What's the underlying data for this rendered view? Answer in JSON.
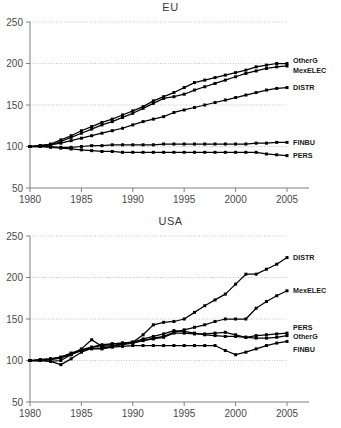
{
  "figure": {
    "panels": [
      "EU",
      "USA"
    ],
    "width": 341,
    "height": 428,
    "background": "#ffffff",
    "line_color": "#000000",
    "grid_color": "#b5b5b5",
    "axis_color": "#808080"
  },
  "chart_data": [
    {
      "type": "line",
      "title": "EU",
      "xlabel": "",
      "ylabel": "",
      "xlim": [
        1980,
        2005
      ],
      "ylim": [
        50,
        250
      ],
      "xticks": [
        1980,
        1985,
        1990,
        1995,
        2000,
        2005
      ],
      "yticks": [
        50,
        100,
        150,
        200,
        250
      ],
      "grid": true,
      "grid_axis": "y",
      "legend": "right-inline",
      "marker": "square",
      "x": [
        1980,
        1981,
        1982,
        1983,
        1984,
        1985,
        1986,
        1987,
        1988,
        1989,
        1990,
        1991,
        1992,
        1993,
        1994,
        1995,
        1996,
        1997,
        1998,
        1999,
        2000,
        2001,
        2002,
        2003,
        2004,
        2005
      ],
      "series": [
        {
          "name": "OtherG",
          "label": "OtherG",
          "end_value": 200,
          "values": [
            100,
            101,
            103,
            108,
            113,
            119,
            124,
            129,
            133,
            138,
            143,
            148,
            155,
            160,
            165,
            171,
            177,
            180,
            183,
            186,
            189,
            192,
            196,
            198,
            200,
            200
          ]
        },
        {
          "name": "MexELEC",
          "label": "MexELEC",
          "end_value": 197,
          "values": [
            100,
            101,
            102,
            106,
            111,
            116,
            121,
            126,
            130,
            135,
            140,
            146,
            152,
            158,
            160,
            163,
            168,
            172,
            176,
            180,
            184,
            188,
            191,
            194,
            196,
            197
          ]
        },
        {
          "name": "DISTR",
          "label": "DISTR",
          "end_value": 171,
          "values": [
            100,
            101,
            102,
            104,
            107,
            110,
            113,
            116,
            119,
            122,
            126,
            130,
            133,
            136,
            141,
            144,
            147,
            150,
            153,
            156,
            159,
            162,
            165,
            168,
            170,
            171
          ]
        },
        {
          "name": "FINBU",
          "label": "FINBU",
          "end_value": 105,
          "values": [
            100,
            100,
            100,
            99,
            99,
            100,
            101,
            101,
            102,
            102,
            102,
            102,
            102,
            103,
            103,
            103,
            103,
            103,
            103,
            103,
            103,
            103,
            104,
            104,
            105,
            105
          ]
        },
        {
          "name": "PERS",
          "label": "PERS",
          "end_value": 89,
          "values": [
            100,
            100,
            99,
            98,
            97,
            96,
            95,
            94,
            94,
            93,
            93,
            93,
            93,
            93,
            93,
            93,
            93,
            93,
            93,
            93,
            93,
            93,
            93,
            91,
            90,
            89
          ]
        }
      ]
    },
    {
      "type": "line",
      "title": "USA",
      "xlabel": "",
      "ylabel": "",
      "xlim": [
        1980,
        2005
      ],
      "ylim": [
        50,
        250
      ],
      "xticks": [
        1980,
        1985,
        1990,
        1995,
        2000,
        2005
      ],
      "yticks": [
        50,
        100,
        150,
        200,
        250
      ],
      "grid": true,
      "grid_axis": "y",
      "legend": "right-inline",
      "marker": "square",
      "x": [
        1980,
        1981,
        1982,
        1983,
        1984,
        1985,
        1986,
        1987,
        1988,
        1989,
        1990,
        1991,
        1992,
        1993,
        1994,
        1995,
        1996,
        1997,
        1998,
        1999,
        2000,
        2001,
        2002,
        2003,
        2004,
        2005
      ],
      "series": [
        {
          "name": "DISTR",
          "label": "DISTR",
          "end_value": 224,
          "values": [
            100,
            100,
            101,
            103,
            107,
            112,
            116,
            119,
            120,
            121,
            122,
            131,
            143,
            146,
            147,
            150,
            158,
            166,
            173,
            180,
            192,
            204,
            204,
            210,
            216,
            224
          ]
        },
        {
          "name": "MexELEC",
          "label": "MexELEC",
          "end_value": 184,
          "values": [
            100,
            100,
            99,
            95,
            102,
            110,
            115,
            115,
            117,
            119,
            121,
            124,
            127,
            129,
            134,
            137,
            140,
            143,
            147,
            150,
            150,
            150,
            163,
            171,
            178,
            184
          ]
        },
        {
          "name": "PERS",
          "label": "PERS",
          "end_value": 133,
          "values": [
            100,
            101,
            102,
            104,
            109,
            113,
            116,
            118,
            120,
            121,
            122,
            126,
            129,
            132,
            136,
            135,
            133,
            131,
            130,
            129,
            129,
            128,
            130,
            131,
            132,
            133
          ]
        },
        {
          "name": "OtherG",
          "label": "OtherG",
          "end_value": 130,
          "values": [
            100,
            100,
            99,
            100,
            107,
            114,
            125,
            117,
            118,
            120,
            122,
            124,
            126,
            128,
            133,
            133,
            132,
            132,
            133,
            134,
            131,
            128,
            127,
            127,
            128,
            130
          ]
        },
        {
          "name": "FINBU",
          "label": "FINBU",
          "end_value": 123,
          "values": [
            100,
            101,
            102,
            104,
            108,
            112,
            114,
            114,
            116,
            117,
            118,
            118,
            118,
            118,
            118,
            118,
            118,
            118,
            118,
            112,
            107,
            110,
            114,
            118,
            121,
            123
          ]
        }
      ]
    }
  ]
}
